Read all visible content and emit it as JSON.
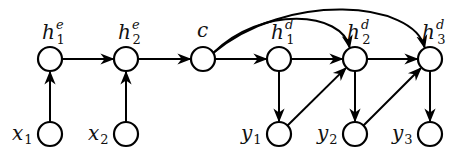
{
  "diagram": {
    "type": "seq2seq-graphical-model",
    "colors": {
      "stroke": "#000000",
      "background": "#ffffff"
    },
    "nodes": [
      {
        "id": "x1",
        "base": "x",
        "sub": "1",
        "sup": "",
        "cx": 50,
        "cy": 134,
        "label_pos": "left"
      },
      {
        "id": "x2",
        "base": "x",
        "sub": "2",
        "sup": "",
        "cx": 126,
        "cy": 134,
        "label_pos": "left"
      },
      {
        "id": "h1e",
        "base": "h",
        "sub": "1",
        "sup": "e",
        "cx": 50,
        "cy": 59,
        "label_pos": "top"
      },
      {
        "id": "h2e",
        "base": "h",
        "sub": "2",
        "sup": "e",
        "cx": 126,
        "cy": 59,
        "label_pos": "top"
      },
      {
        "id": "c",
        "base": "c",
        "sub": "",
        "sup": "",
        "cx": 203,
        "cy": 59,
        "label_pos": "top"
      },
      {
        "id": "h1d",
        "base": "h",
        "sub": "1",
        "sup": "d",
        "cx": 279,
        "cy": 59,
        "label_pos": "top"
      },
      {
        "id": "h2d",
        "base": "h",
        "sub": "2",
        "sup": "d",
        "cx": 355,
        "cy": 59,
        "label_pos": "top"
      },
      {
        "id": "h3d",
        "base": "h",
        "sub": "3",
        "sup": "d",
        "cx": 430,
        "cy": 59,
        "label_pos": "top"
      },
      {
        "id": "y1",
        "base": "y",
        "sub": "1",
        "sup": "",
        "cx": 279,
        "cy": 134,
        "label_pos": "left"
      },
      {
        "id": "y2",
        "base": "y",
        "sub": "2",
        "sup": "",
        "cx": 355,
        "cy": 134,
        "label_pos": "left"
      },
      {
        "id": "y3",
        "base": "y",
        "sub": "3",
        "sup": "",
        "cx": 430,
        "cy": 134,
        "label_pos": "left"
      }
    ],
    "edges": [
      {
        "from": "x1",
        "to": "h1e"
      },
      {
        "from": "x2",
        "to": "h2e"
      },
      {
        "from": "h1e",
        "to": "h2e"
      },
      {
        "from": "h2e",
        "to": "c"
      },
      {
        "from": "c",
        "to": "h1d"
      },
      {
        "from": "c",
        "to": "h2d",
        "curved": true
      },
      {
        "from": "c",
        "to": "h3d",
        "curved": true
      },
      {
        "from": "h1d",
        "to": "h2d"
      },
      {
        "from": "h2d",
        "to": "h3d"
      },
      {
        "from": "h1d",
        "to": "y1"
      },
      {
        "from": "h2d",
        "to": "y2"
      },
      {
        "from": "h3d",
        "to": "y3"
      },
      {
        "from": "y1",
        "to": "h2d"
      },
      {
        "from": "y2",
        "to": "h3d"
      }
    ]
  }
}
